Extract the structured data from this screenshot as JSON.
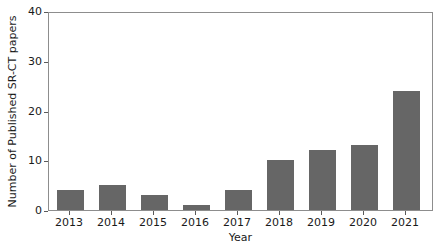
{
  "chart_data": {
    "type": "bar",
    "title": "",
    "xlabel": "Year",
    "ylabel": "Number of Published SR-CT papers",
    "categories": [
      "2013",
      "2014",
      "2015",
      "2016",
      "2017",
      "2018",
      "2019",
      "2020",
      "2021"
    ],
    "values": [
      4,
      5,
      3,
      1,
      4,
      10,
      12,
      13,
      24
    ],
    "ylim": [
      0,
      40
    ],
    "yticks": [
      0,
      10,
      20,
      30,
      40
    ],
    "ytick_labels": [
      "0",
      "10",
      "20",
      "30",
      "40"
    ],
    "xtick_labels": [
      "2013",
      "2014",
      "2015",
      "2016",
      "2017",
      "2018",
      "2019",
      "2020",
      "2021"
    ],
    "grid": false,
    "legend": null,
    "bar_color": "#666666",
    "axis_color": "#8d8d8d",
    "text_color": "#1a1a1a",
    "background": "#ffffff"
  }
}
